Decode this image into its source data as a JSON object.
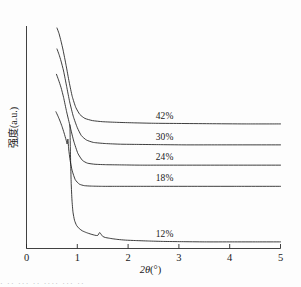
{
  "chart_data": {
    "type": "line",
    "title": "",
    "xlabel": "2θ(°)",
    "ylabel": "强度(a.u.)",
    "xlim": [
      0,
      5
    ],
    "ylim": [
      0,
      1
    ],
    "grid": false,
    "legend_position": "inline-right-of-curve",
    "xticks": [
      "0",
      "1",
      "2",
      "3",
      "4",
      "5"
    ],
    "yticks": [],
    "note": "Stacked / vertically offset small-angle scattering curves; y in arbitrary units with no numeric ticks.",
    "series": [
      {
        "name": "42%",
        "label": "42%",
        "label_x": 2.72,
        "baseline_y": 0.565,
        "x": [
          0.6,
          0.64,
          0.68,
          0.72,
          0.78,
          0.84,
          0.9,
          0.97,
          1.05,
          1.15,
          1.3,
          1.5,
          1.8,
          2.1,
          2.5,
          3.0,
          3.6,
          4.3,
          5.0
        ],
        "y": [
          1.0,
          0.975,
          0.94,
          0.9,
          0.83,
          0.755,
          0.69,
          0.64,
          0.608,
          0.59,
          0.58,
          0.575,
          0.572,
          0.57,
          0.568,
          0.567,
          0.566,
          0.565,
          0.565
        ]
      },
      {
        "name": "30%",
        "label": "30%",
        "label_x": 2.72,
        "baseline_y": 0.47,
        "x": [
          0.6,
          0.64,
          0.68,
          0.73,
          0.79,
          0.85,
          0.92,
          1.0,
          1.08,
          1.18,
          1.32,
          1.55,
          1.85,
          2.2,
          2.6,
          3.1,
          3.7,
          4.4,
          5.0
        ],
        "y": [
          0.905,
          0.88,
          0.85,
          0.805,
          0.735,
          0.665,
          0.6,
          0.548,
          0.512,
          0.492,
          0.481,
          0.476,
          0.473,
          0.472,
          0.471,
          0.47,
          0.47,
          0.47,
          0.47
        ]
      },
      {
        "name": "24%",
        "label": "24%",
        "label_x": 2.72,
        "baseline_y": 0.378,
        "x": [
          0.59,
          0.63,
          0.68,
          0.73,
          0.79,
          0.86,
          0.93,
          1.01,
          1.1,
          1.2,
          1.35,
          1.58,
          1.9,
          2.25,
          2.65,
          3.15,
          3.75,
          4.4,
          5.0
        ],
        "y": [
          0.79,
          0.765,
          0.73,
          0.685,
          0.62,
          0.552,
          0.487,
          0.432,
          0.4,
          0.387,
          0.382,
          0.38,
          0.379,
          0.378,
          0.378,
          0.378,
          0.378,
          0.378,
          0.378
        ]
      },
      {
        "name": "18%",
        "label": "18%",
        "label_x": 2.72,
        "baseline_y": 0.282,
        "x": [
          0.58,
          0.62,
          0.66,
          0.7,
          0.74,
          0.78,
          0.8,
          0.815,
          0.83,
          0.86,
          0.9,
          0.96,
          1.04,
          1.14,
          1.28,
          1.5,
          1.8,
          2.2,
          2.7,
          3.3,
          4.1,
          5.0
        ],
        "y": [
          0.62,
          0.6,
          0.578,
          0.553,
          0.524,
          0.492,
          0.474,
          0.496,
          0.452,
          0.398,
          0.352,
          0.312,
          0.292,
          0.285,
          0.283,
          0.282,
          0.282,
          0.282,
          0.282,
          0.282,
          0.282,
          0.282
        ]
      },
      {
        "name": "12%",
        "label": "12%",
        "label_x": 2.72,
        "baseline_y": 0.03,
        "x": [
          0.855,
          0.862,
          0.87,
          0.88,
          0.895,
          0.915,
          0.945,
          0.985,
          1.04,
          1.1,
          1.18,
          1.27,
          1.35,
          1.4,
          1.44,
          1.47,
          1.5,
          1.55,
          1.62,
          1.7,
          1.8,
          1.95,
          2.15,
          2.4,
          2.7,
          3.05,
          3.5,
          4.05,
          4.55,
          5.0
        ],
        "y": [
          0.56,
          0.47,
          0.38,
          0.295,
          0.22,
          0.165,
          0.128,
          0.105,
          0.09,
          0.08,
          0.072,
          0.065,
          0.06,
          0.059,
          0.072,
          0.064,
          0.055,
          0.05,
          0.047,
          0.044,
          0.041,
          0.038,
          0.036,
          0.034,
          0.032,
          0.031,
          0.03,
          0.03,
          0.03,
          0.03
        ]
      }
    ]
  },
  "axes": {
    "x_axis_label": "2θ(°)",
    "x_axis_label_symbol": "2θ",
    "x_axis_label_unit": "(°)",
    "y_axis_label": "强度(a.u.)",
    "tick_labels": [
      "0",
      "1",
      "2",
      "3",
      "4",
      "5"
    ]
  },
  "caption": {
    "partial_text": "·  ··  ···  ·· ····  ···  ··"
  }
}
